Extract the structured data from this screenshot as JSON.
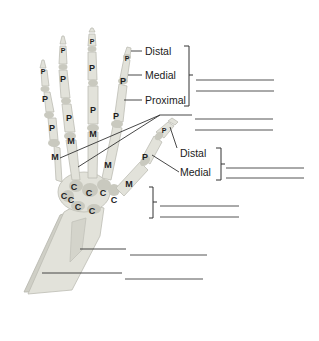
{
  "diagram": {
    "bone_letters": {
      "phalanx": "P",
      "metacarpal": "M",
      "carpal": "C"
    },
    "finger_labels": {
      "distal": "Distal",
      "medial": "Medial",
      "proximal": "Proximal"
    },
    "thumb_labels": {
      "distal": "Distal",
      "medial": "Medial"
    },
    "answer_blanks": [
      {
        "id": "phalanges-1",
        "value": ""
      },
      {
        "id": "phalanges-2",
        "value": ""
      },
      {
        "id": "metacarpals-1",
        "value": ""
      },
      {
        "id": "metacarpals-2",
        "value": ""
      },
      {
        "id": "thumb-phalanges-1",
        "value": ""
      },
      {
        "id": "thumb-phalanges-2",
        "value": ""
      },
      {
        "id": "carpals-1",
        "value": ""
      },
      {
        "id": "carpals-2",
        "value": ""
      },
      {
        "id": "radius",
        "value": ""
      },
      {
        "id": "ulna",
        "value": ""
      }
    ]
  }
}
